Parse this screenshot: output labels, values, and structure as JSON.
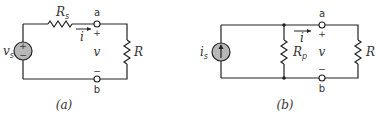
{
  "figure": {
    "panel_a": {
      "caption": "(a)",
      "source": {
        "type": "voltage",
        "symbol": "v",
        "subscript": "s",
        "plus": "+",
        "minus": "−"
      },
      "series_resistor": {
        "symbol": "R",
        "subscript": "s"
      },
      "load_resistor": {
        "symbol": "R"
      },
      "terminal_top": "a",
      "terminal_bottom": "b",
      "current": {
        "symbol": "i"
      },
      "voltage": {
        "symbol": "v",
        "plus": "+",
        "minus": "−"
      }
    },
    "panel_b": {
      "caption": "(b)",
      "source": {
        "type": "current",
        "symbol": "i",
        "subscript": "s"
      },
      "parallel_resistor": {
        "symbol": "R",
        "subscript": "p"
      },
      "load_resistor": {
        "symbol": "R"
      },
      "terminal_top": "a",
      "terminal_bottom": "b",
      "current": {
        "symbol": "i"
      },
      "voltage": {
        "symbol": "v",
        "plus": "+",
        "minus": "−"
      }
    },
    "colors": {
      "wire": "#222222",
      "source_fill": "#b8b8b8",
      "background": "#ffffff"
    }
  }
}
